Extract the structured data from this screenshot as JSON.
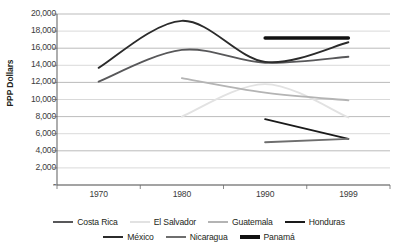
{
  "chart_data": {
    "type": "line",
    "title": "",
    "xlabel": "",
    "ylabel": "PPP Dollars",
    "x": [
      1970,
      1980,
      1990,
      1999
    ],
    "categories": [
      "1970",
      "1980",
      "1990",
      "1999"
    ],
    "ylim": [
      0,
      20000
    ],
    "ytick_values": [
      0,
      2000,
      4000,
      6000,
      8000,
      10000,
      12000,
      14000,
      16000,
      18000,
      20000
    ],
    "ytick_labels": [
      "-",
      "2,000",
      "4,000",
      "6,000",
      "8,000",
      "10,000",
      "12,000",
      "14,000",
      "16,000",
      "18,000",
      "20,000"
    ],
    "grid": true,
    "legend_position": "bottom",
    "series": [
      {
        "name": "Costa Rica",
        "color": "#58585a",
        "width": 1.9,
        "x": [
          1970,
          1980,
          1990,
          1999
        ],
        "values": [
          12100,
          15800,
          14300,
          15000
        ]
      },
      {
        "name": "El Salvador",
        "color": "#e2e2e2",
        "width": 1.9,
        "x": [
          1980,
          1990,
          1999
        ],
        "values": [
          8000,
          11800,
          7900
        ]
      },
      {
        "name": "Guatemala",
        "color": "#b4b4b4",
        "width": 1.9,
        "x": [
          1980,
          1990,
          1999
        ],
        "values": [
          12500,
          10800,
          9900
        ]
      },
      {
        "name": "Honduras",
        "color": "#1a1a1a",
        "width": 1.9,
        "x": [
          1990,
          1999
        ],
        "values": [
          7700,
          5400
        ]
      },
      {
        "name": "México",
        "color": "#2b2b2b",
        "width": 1.9,
        "x": [
          1970,
          1980,
          1990,
          1999
        ],
        "values": [
          13700,
          19200,
          14400,
          16700
        ]
      },
      {
        "name": "Nicaragua",
        "color": "#6e6e6e",
        "width": 1.9,
        "x": [
          1990,
          1999
        ],
        "values": [
          5000,
          5400
        ]
      },
      {
        "name": "Panamá",
        "color": "#111111",
        "width": 3.4,
        "x": [
          1990,
          1999
        ],
        "values": [
          17200,
          17200
        ]
      }
    ]
  },
  "legend": {
    "row1": [
      "Costa Rica",
      "El Salvador",
      "Guatemala",
      "Honduras"
    ],
    "row2": [
      "México",
      "Nicaragua",
      "Panamá"
    ]
  }
}
